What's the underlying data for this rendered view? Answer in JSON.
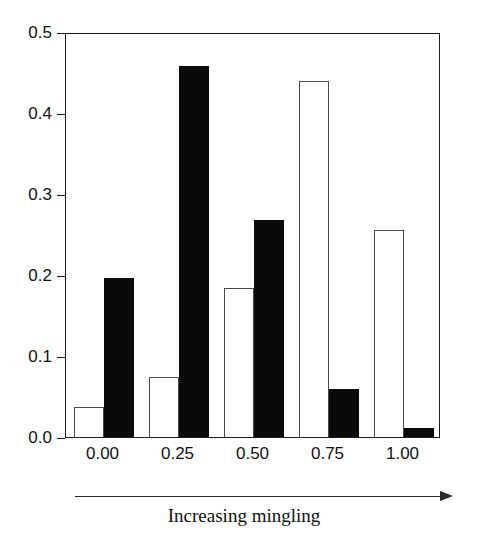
{
  "chart_data": {
    "type": "bar",
    "title": "Proportions of trees",
    "xlabel": "Increasing mingling",
    "ylabel": "",
    "categories": [
      "0.00",
      "0.25",
      "0.50",
      "0.75",
      "1.00"
    ],
    "series": [
      {
        "name": "hollow",
        "style": "white-fill-black-outline",
        "values": [
          0.037,
          0.074,
          0.184,
          0.44,
          0.256
        ]
      },
      {
        "name": "filled",
        "style": "black-fill",
        "values": [
          0.196,
          0.458,
          0.268,
          0.059,
          0.011
        ]
      }
    ],
    "ylim": [
      0.0,
      0.5
    ],
    "xlim": [
      -0.125,
      1.125
    ],
    "y_ticks": [
      "0.0",
      "0.1",
      "0.2",
      "0.3",
      "0.4",
      "0.5"
    ],
    "y_tick_values": [
      0.0,
      0.1,
      0.2,
      0.3,
      0.4,
      0.5
    ],
    "x_ticks": [
      "0.00",
      "0.25",
      "0.50",
      "0.75",
      "1.00"
    ],
    "grid": false,
    "legend": "none",
    "annotations": [
      "Proportions of trees",
      "Increasing mingling"
    ],
    "axis_arrow": "right-pointing-arrow-below-x-axis"
  },
  "colors": {
    "filled_bar": "#0a0a0a",
    "hollow_bar_fill": "#ffffff",
    "hollow_bar_outline": "#4a4a4a",
    "frame": "#1a1a1a",
    "text": "#111111",
    "background": "#ffffff"
  }
}
